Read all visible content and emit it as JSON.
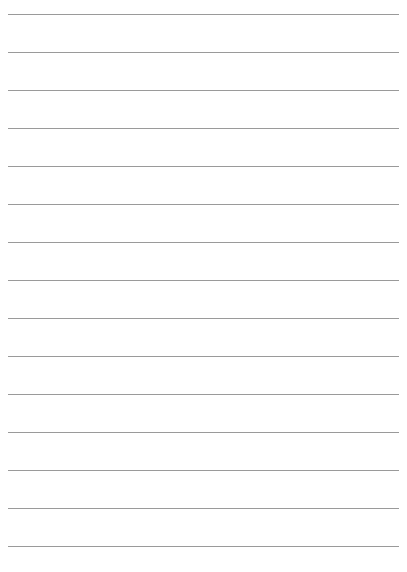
{
  "page": {
    "type": "lined-paper",
    "background_color": "#ffffff",
    "line_color": "#9a9a9a",
    "line_count": 15,
    "first_line_y": 14,
    "line_spacing": 38,
    "line_left": 8,
    "line_width": 391
  }
}
